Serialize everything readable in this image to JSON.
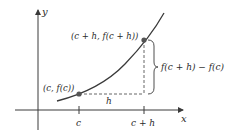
{
  "diagram": {
    "type": "secant-difference-quotient",
    "axes": {
      "x_label": "x",
      "y_label": "y"
    },
    "points": [
      {
        "id": "p1",
        "label": "(c, f(c))",
        "x_value": "c"
      },
      {
        "id": "p2",
        "label": "(c + h, f(c + h))",
        "x_value": "c + h"
      }
    ],
    "ticks": [
      {
        "label": "c"
      },
      {
        "label": "c + h"
      }
    ],
    "horizontal_gap_label": "h",
    "vertical_gap_label": "f(c + h) − f(c)",
    "colors": {
      "axis": "#3a3a3a",
      "curve": "#3a3a3a",
      "point": "#555555",
      "dashed": "#555555",
      "text": "#2a2a2a"
    }
  }
}
